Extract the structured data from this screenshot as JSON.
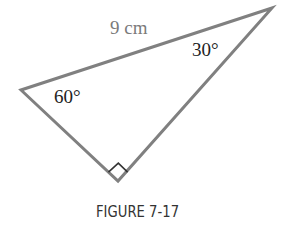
{
  "figure": {
    "caption": "FIGURE 7-17",
    "triangle": {
      "vertices": {
        "top_right": [
          272,
          8
        ],
        "left": [
          21,
          90
        ],
        "bottom_right_angle": [
          118,
          181
        ]
      },
      "stroke_color": "#7f7f7f",
      "right_angle_marker": true
    },
    "labels": {
      "hypotenuse": "9 cm",
      "angle_top_right": "30°",
      "angle_left": "60°"
    }
  }
}
